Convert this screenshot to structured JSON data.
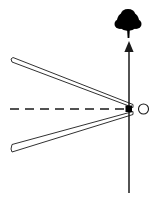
{
  "canvas": {
    "width": 160,
    "height": 199,
    "background_color": "#ffffff",
    "stroke_color": "#1a1a1a",
    "fill_color": "#000000"
  },
  "diagram": {
    "title": "",
    "type": "mechanism-schematic"
  },
  "elements": {
    "upper_arm": {
      "label": "upper arm",
      "tip_x": 11,
      "tip_y": 61,
      "pivot_x": 132,
      "pivot_y": 106,
      "thickness": 4
    },
    "lower_arm": {
      "label": "lower arm",
      "tip_x": 11,
      "tip_y": 147,
      "pivot_x": 132,
      "pivot_y": 113,
      "thickness": 4
    },
    "pivot_block": {
      "label": "pivot block",
      "x": 126,
      "y": 106,
      "width": 6,
      "height": 6,
      "color": "#000000"
    },
    "roller_pin": {
      "label": "roller pin",
      "cx": 144,
      "cy": 109,
      "rx": 5,
      "ry": 5,
      "color": "#1a1a1a"
    },
    "axis_line": {
      "label": "axis of symmetry",
      "x1": 10,
      "y1": 109,
      "x2": 128,
      "y2": 109,
      "style": "dashed",
      "dash": "9 6"
    },
    "force_arrow": {
      "label": "force arrow",
      "x": 129,
      "y_tail": 193,
      "y_head": 42,
      "direction": "up",
      "head_width": 9,
      "head_height": 11
    },
    "tree": {
      "label": "tree",
      "crown_cx": 128,
      "crown_cy": 21,
      "crown_rx": 11,
      "crown_ry": 10,
      "trunk_x": 126,
      "trunk_y": 26,
      "trunk_width": 4,
      "trunk_height": 12,
      "color": "#000000"
    }
  }
}
